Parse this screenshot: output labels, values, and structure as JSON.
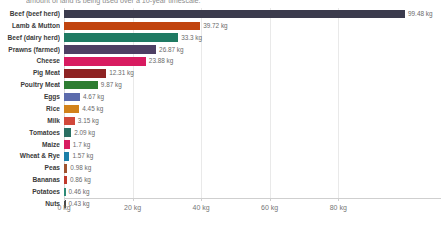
{
  "chart_data": {
    "type": "bar",
    "orientation": "horizontal",
    "title": "amount of land is being used over a 10-year timescale.",
    "xlabel": "",
    "ylabel": "",
    "xlim": [
      0,
      99.48
    ],
    "grid": true,
    "legend": "none",
    "unit": "kg",
    "axis_ticks": [
      {
        "value": 0,
        "label": "0 kg"
      },
      {
        "value": 20,
        "label": "20 kg"
      },
      {
        "value": 40,
        "label": "40 kg"
      },
      {
        "value": 60,
        "label": "60 kg"
      },
      {
        "value": 80,
        "label": "80 kg"
      }
    ],
    "categories": [
      "Beef (beef herd)",
      "Lamb & Mutton",
      "Beef (dairy herd)",
      "Prawns (farmed)",
      "Cheese",
      "Pig Meat",
      "Poultry Meat",
      "Eggs",
      "Rice",
      "Milk",
      "Tomatoes",
      "Maize",
      "Wheat & Rye",
      "Peas",
      "Bananas",
      "Potatoes",
      "Nuts"
    ],
    "values": [
      99.48,
      39.72,
      33.3,
      26.87,
      23.88,
      12.31,
      9.87,
      4.67,
      4.45,
      3.15,
      2.09,
      1.7,
      1.57,
      0.98,
      0.86,
      0.46,
      0.43
    ],
    "value_labels": [
      "99.48 kg",
      "39.72 kg",
      "33.3 kg",
      "26.87 kg",
      "23.88 kg",
      "12.31 kg",
      "9.87 kg",
      "4.67 kg",
      "4.45 kg",
      "3.15 kg",
      "2.09 kg",
      "1.7 kg",
      "1.57 kg",
      "0.98 kg",
      "0.86 kg",
      "0.46 kg",
      "0.43 kg"
    ],
    "colors": [
      "#3b3b4d",
      "#c1440e",
      "#1f7a63",
      "#4e3f63",
      "#d81b60",
      "#8e2323",
      "#2e7d32",
      "#5c6bac",
      "#d2821a",
      "#d1483a",
      "#2a6f62",
      "#d81b60",
      "#1b7fa8",
      "#a0522d",
      "#c0392b",
      "#2e8b77",
      "#4a4a4a"
    ],
    "rows": [
      {
        "label": "Beef (beef herd)",
        "value": 99.48,
        "value_label": "99.48 kg",
        "color": "#3b3b4d"
      },
      {
        "label": "Lamb & Mutton",
        "value": 39.72,
        "value_label": "39.72 kg",
        "color": "#c1440e"
      },
      {
        "label": "Beef (dairy herd)",
        "value": 33.3,
        "value_label": "33.3 kg",
        "color": "#1f7a63"
      },
      {
        "label": "Prawns (farmed)",
        "value": 26.87,
        "value_label": "26.87 kg",
        "color": "#4e3f63"
      },
      {
        "label": "Cheese",
        "value": 23.88,
        "value_label": "23.88 kg",
        "color": "#d81b60"
      },
      {
        "label": "Pig Meat",
        "value": 12.31,
        "value_label": "12.31 kg",
        "color": "#8e2323"
      },
      {
        "label": "Poultry Meat",
        "value": 9.87,
        "value_label": "9.87 kg",
        "color": "#2e7d32"
      },
      {
        "label": "Eggs",
        "value": 4.67,
        "value_label": "4.67 kg",
        "color": "#5c6bac"
      },
      {
        "label": "Rice",
        "value": 4.45,
        "value_label": "4.45 kg",
        "color": "#d2821a"
      },
      {
        "label": "Milk",
        "value": 3.15,
        "value_label": "3.15 kg",
        "color": "#d1483a"
      },
      {
        "label": "Tomatoes",
        "value": 2.09,
        "value_label": "2.09 kg",
        "color": "#2a6f62"
      },
      {
        "label": "Maize",
        "value": 1.7,
        "value_label": "1.7 kg",
        "color": "#d81b60"
      },
      {
        "label": "Wheat & Rye",
        "value": 1.57,
        "value_label": "1.57 kg",
        "color": "#1b7fa8"
      },
      {
        "label": "Peas",
        "value": 0.98,
        "value_label": "0.98 kg",
        "color": "#a0522d"
      },
      {
        "label": "Bananas",
        "value": 0.86,
        "value_label": "0.86 kg",
        "color": "#c0392b"
      },
      {
        "label": "Potatoes",
        "value": 0.46,
        "value_label": "0.46 kg",
        "color": "#2e8b77"
      },
      {
        "label": "Nuts",
        "value": 0.43,
        "value_label": "0.43 kg",
        "color": "#4a4a4a"
      }
    ]
  }
}
